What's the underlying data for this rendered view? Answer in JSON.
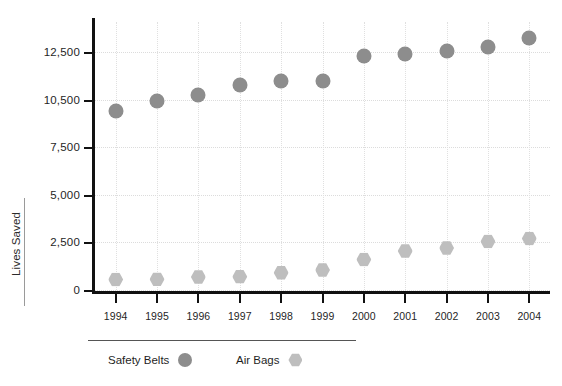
{
  "chart_data": {
    "type": "scatter",
    "title": "",
    "xlabel": "",
    "ylabel": "Lives Saved",
    "grid": true,
    "legend_position": "bottom-left",
    "categories": [
      "1994",
      "1995",
      "1996",
      "1997",
      "1998",
      "1999",
      "2000",
      "2001",
      "2002",
      "2003",
      "2004"
    ],
    "y_tick_labels": [
      "0",
      "2,500",
      "5,000",
      "7,500",
      "10,500",
      "12,500"
    ],
    "y_tick_values": [
      0,
      2500,
      5000,
      7500,
      10500,
      12500
    ],
    "ylim": [
      0,
      13600
    ],
    "series": [
      {
        "name": "Safety Belts",
        "marker": "circle",
        "color": "#8d8d8d",
        "values": [
          9800,
          10400,
          10700,
          11100,
          11300,
          11300,
          12350,
          12400,
          12550,
          12700,
          13100
        ]
      },
      {
        "name": "Air Bags",
        "marker": "hexagon",
        "color": "#bebebe",
        "values": [
          550,
          560,
          680,
          700,
          900,
          1050,
          1600,
          2050,
          2200,
          2550,
          2700
        ]
      }
    ]
  },
  "axes": {
    "y_title": "Lives Saved"
  },
  "legend": {
    "entries": [
      {
        "label": "Safety Belts",
        "marker": "circle"
      },
      {
        "label": "Air Bags",
        "marker": "hexagon"
      }
    ]
  }
}
